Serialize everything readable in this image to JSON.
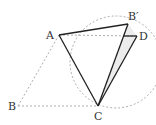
{
  "diagram": {
    "type": "geometry",
    "circle": {
      "cx": 116,
      "cy": 60,
      "r": 46,
      "style": "dashed"
    },
    "points": {
      "A": {
        "label": "A",
        "x": 59,
        "y": 35
      },
      "Bp": {
        "label": "B′",
        "x": 128,
        "y": 24
      },
      "D": {
        "label": "D",
        "x": 137,
        "y": 36
      },
      "C": {
        "label": "C",
        "x": 98,
        "y": 106
      },
      "B": {
        "label": "B",
        "x": 18,
        "y": 106
      }
    },
    "solid_segments": [
      "AB′",
      "AC",
      "B′C",
      "DC",
      "B′D"
    ],
    "dashed_segments": [
      "AD",
      "AB",
      "BC"
    ],
    "shaded_region": "B′DC",
    "colors": {
      "line": "#222222",
      "dashed": "#888888",
      "shade": "#eeeeee"
    }
  }
}
